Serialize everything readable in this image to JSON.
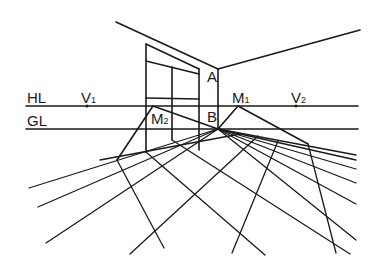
{
  "diagram": {
    "stroke_color": "#1a1a1a",
    "background": "#ffffff",
    "reference_lines": {
      "horizon_line": {
        "label": "HL",
        "y": 106,
        "x1": 26,
        "x2": 358
      },
      "ground_line": {
        "label": "GL",
        "y": 129,
        "x1": 26,
        "x2": 358
      }
    },
    "points": {
      "V1": {
        "label": "V",
        "sub": "1",
        "x": 87,
        "y": 106
      },
      "V2": {
        "label": "V",
        "sub": "2",
        "x": 296,
        "y": 106
      },
      "M1": {
        "label": "M",
        "sub": "1",
        "x": 238,
        "y": 106
      },
      "M2": {
        "label": "M",
        "sub": "2",
        "x": 153,
        "y": 106
      },
      "A": {
        "label": "A",
        "x": 218,
        "y": 69
      },
      "B": {
        "label": "B",
        "x": 218,
        "y": 128
      }
    },
    "labels": [
      {
        "id": "hl",
        "text": "HL",
        "sub": "",
        "x": 27,
        "y": 103
      },
      {
        "id": "gl",
        "text": "GL",
        "sub": "",
        "x": 27,
        "y": 126
      },
      {
        "id": "v1",
        "text": "V",
        "sub": "1",
        "x": 81,
        "y": 103
      },
      {
        "id": "v2",
        "text": "V",
        "sub": "2",
        "x": 291,
        "y": 103
      },
      {
        "id": "m1",
        "text": "M",
        "sub": "1",
        "x": 232,
        "y": 103
      },
      {
        "id": "m2",
        "text": "M",
        "sub": "2",
        "x": 151,
        "y": 124
      },
      {
        "id": "a",
        "text": "A",
        "sub": "",
        "x": 207,
        "y": 82
      },
      {
        "id": "b",
        "text": "B",
        "sub": "",
        "x": 207,
        "y": 122
      }
    ],
    "walls": [
      {
        "id": "ceiling-left",
        "x1": 116,
        "y1": 22,
        "x2": 218,
        "y2": 69
      },
      {
        "id": "ceiling-right",
        "x1": 218,
        "y1": 69,
        "x2": 360,
        "y2": 30
      },
      {
        "id": "corner-edge",
        "x1": 218,
        "y1": 69,
        "x2": 218,
        "y2": 129
      }
    ],
    "window": [
      {
        "id": "window-left",
        "x1": 146,
        "y1": 44,
        "x2": 146,
        "y2": 152
      },
      {
        "id": "window-top",
        "x1": 146,
        "y1": 44,
        "x2": 199,
        "y2": 69
      },
      {
        "id": "window-sill-upper",
        "x1": 146,
        "y1": 61,
        "x2": 199,
        "y2": 74
      },
      {
        "id": "window-right",
        "x1": 199,
        "y1": 69,
        "x2": 199,
        "y2": 150
      },
      {
        "id": "window-mullion",
        "x1": 172,
        "y1": 67,
        "x2": 172,
        "y2": 140
      },
      {
        "id": "window-transom",
        "x1": 146,
        "y1": 98,
        "x2": 199,
        "y2": 99
      }
    ],
    "construction_lines": [
      {
        "id": "m2-to-b",
        "x1": 153,
        "y1": 106,
        "x2": 218,
        "y2": 129
      },
      {
        "id": "m1-to-b",
        "x1": 238,
        "y1": 106,
        "x2": 218,
        "y2": 129
      },
      {
        "id": "m2-left-down",
        "x1": 153,
        "y1": 106,
        "x2": 117,
        "y2": 160
      },
      {
        "id": "m1-right-down",
        "x1": 238,
        "y1": 106,
        "x2": 308,
        "y2": 144
      }
    ],
    "floor_grid_left_ray": [
      {
        "x1": 218,
        "y1": 129,
        "x2": 29,
        "y2": 188
      },
      {
        "x1": 218,
        "y1": 129,
        "x2": 38,
        "y2": 207
      },
      {
        "x1": 218,
        "y1": 129,
        "x2": 46,
        "y2": 243
      }
    ],
    "floor_grid_right_ray": [
      {
        "x1": 218,
        "y1": 129,
        "x2": 356,
        "y2": 155
      },
      {
        "x1": 218,
        "y1": 129,
        "x2": 356,
        "y2": 160
      },
      {
        "x1": 218,
        "y1": 129,
        "x2": 356,
        "y2": 169
      },
      {
        "x1": 218,
        "y1": 129,
        "x2": 356,
        "y2": 183
      },
      {
        "x1": 218,
        "y1": 129,
        "x2": 356,
        "y2": 204
      },
      {
        "x1": 218,
        "y1": 129,
        "x2": 356,
        "y2": 240
      }
    ],
    "floor_grid_crossing": [
      {
        "x1": 117,
        "y1": 160,
        "x2": 164,
        "y2": 248
      },
      {
        "x1": 146,
        "y1": 152,
        "x2": 265,
        "y2": 255
      },
      {
        "x1": 172,
        "y1": 140,
        "x2": 350,
        "y2": 254
      },
      {
        "x1": 308,
        "y1": 144,
        "x2": 336,
        "y2": 253
      },
      {
        "x1": 278,
        "y1": 141,
        "x2": 232,
        "y2": 253
      },
      {
        "x1": 258,
        "y1": 136,
        "x2": 130,
        "y2": 254
      },
      {
        "x1": 240,
        "y1": 134,
        "x2": 100,
        "y2": 160
      }
    ]
  }
}
